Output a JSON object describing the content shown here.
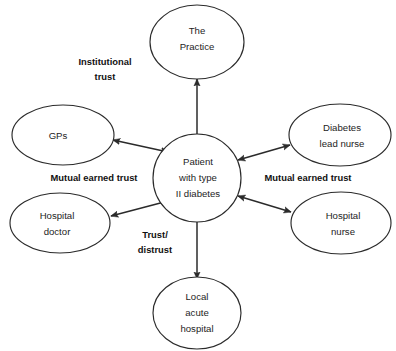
{
  "diagram": {
    "background_color": "#ffffff",
    "stroke_color": "#2b2b2b",
    "text_color": "#1d1d1d"
  },
  "nodes": {
    "center": {
      "id": "patient",
      "shape": "circle",
      "lines": [
        "Patient",
        "with type",
        "II diabetes"
      ],
      "line1": "Patient",
      "line2": "with type",
      "line3": "II diabetes"
    },
    "practice": {
      "id": "the-practice",
      "shape": "ellipse",
      "lines": [
        "The",
        "Practice"
      ],
      "line1": "The",
      "line2": "Practice"
    },
    "gps": {
      "id": "gps",
      "shape": "ellipse",
      "lines": [
        "GPs"
      ],
      "line1": "GPs"
    },
    "hospital_doctor": {
      "id": "hospital-doctor",
      "shape": "ellipse",
      "lines": [
        "Hospital",
        "doctor"
      ],
      "line1": "Hospital",
      "line2": "doctor"
    },
    "diabetes_lead_nurse": {
      "id": "diabetes-lead-nurse",
      "shape": "ellipse",
      "lines": [
        "Diabetes",
        "lead nurse"
      ],
      "line1": "Diabetes",
      "line2": "lead nurse"
    },
    "hospital_nurse": {
      "id": "hospital-nurse",
      "shape": "ellipse",
      "lines": [
        "Hospital",
        "nurse"
      ],
      "line1": "Hospital",
      "line2": "nurse"
    },
    "local_acute_hospital": {
      "id": "local-acute-hospital",
      "shape": "ellipse",
      "lines": [
        "Local",
        "acute",
        "hospital"
      ],
      "line1": "Local",
      "line2": "acute",
      "line3": "hospital"
    }
  },
  "edges": [
    {
      "id": "patient-to-practice",
      "from": "patient",
      "to": "the-practice",
      "arrow": "single",
      "direction": "up",
      "label": "Institutional trust"
    },
    {
      "id": "patient-to-gps",
      "from": "patient",
      "to": "gps",
      "arrow": "double",
      "direction": "up-left",
      "label": "Mutual earned trust"
    },
    {
      "id": "patient-to-hospital-doctor",
      "from": "patient",
      "to": "hospital-doctor",
      "arrow": "double",
      "direction": "down-left",
      "label": "Mutual earned trust"
    },
    {
      "id": "patient-to-diabetes-lead-nurse",
      "from": "patient",
      "to": "diabetes-lead-nurse",
      "arrow": "double",
      "direction": "up-right",
      "label": "Mutual earned trust"
    },
    {
      "id": "patient-to-hospital-nurse",
      "from": "patient",
      "to": "hospital-nurse",
      "arrow": "double",
      "direction": "down-right",
      "label": "Mutual earned trust"
    },
    {
      "id": "patient-to-local-acute-hospital",
      "from": "patient",
      "to": "local-acute-hospital",
      "arrow": "single",
      "direction": "down",
      "label": "Trust/ distrust"
    }
  ],
  "edge_labels": {
    "institutional_trust": {
      "line1": "Institutional",
      "line2": "trust"
    },
    "mutual_earned_trust_left": {
      "line1": "Mutual earned trust"
    },
    "mutual_earned_trust_right": {
      "line1": "Mutual earned trust"
    },
    "trust_distrust": {
      "line1": "Trust/",
      "line2": "distrust"
    }
  }
}
